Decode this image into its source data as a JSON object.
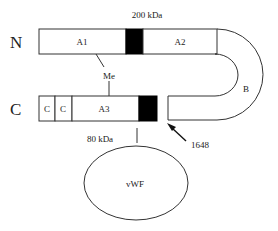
{
  "diagram": {
    "terminals": {
      "n_label": "N",
      "c_label": "C"
    },
    "heavy_chain": {
      "mass_label": "200 kDa",
      "domains": [
        {
          "id": "A1",
          "label": "A1"
        },
        {
          "id": "acidic-1",
          "label": ""
        },
        {
          "id": "A2",
          "label": "A2"
        }
      ]
    },
    "b_domain": {
      "label": "B"
    },
    "light_chain": {
      "mass_label": "80 kDa",
      "domains": [
        {
          "id": "C2",
          "label": "C"
        },
        {
          "id": "C1",
          "label": "C"
        },
        {
          "id": "A3",
          "label": "A3"
        },
        {
          "id": "acidic-3",
          "label": ""
        }
      ]
    },
    "metal_ion": {
      "label": "Me"
    },
    "cleavage_site": {
      "label": "1648"
    },
    "binding_partner": {
      "label": "vWF"
    },
    "colors": {
      "stroke": "#333333",
      "acidic_fill": "#000000",
      "background": "#ffffff"
    }
  }
}
